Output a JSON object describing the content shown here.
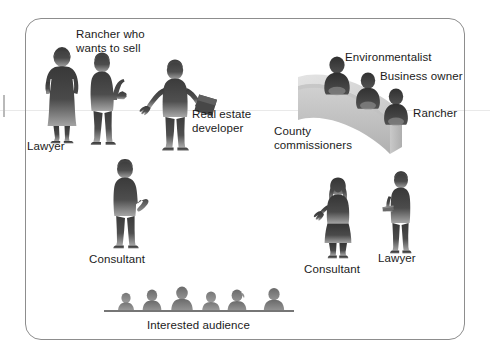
{
  "scene": {
    "title": "Stakeholders at a county land-use hearing",
    "width": 490,
    "height": 354,
    "background_color": "#ffffff",
    "frame_color": "#8d8d8d",
    "silhouette_dark": "#3b3b3b",
    "silhouette_mid": "#565656",
    "silhouette_light": "#9a9a9a",
    "bench_light": "#d9d9d9",
    "bench_mid": "#c2c2c2",
    "bench_shadow": "#a8a8a8",
    "text_color": "#1b1b1b"
  },
  "labels": {
    "lawyer_left": "Lawyer",
    "rancher_who_wants_to_sell": "Rancher who\nwants to sell",
    "real_estate_developer": "Real estate\ndeveloper",
    "consultant_left": "Consultant",
    "environmentalist": "Environmentalist",
    "business_owner": "Business owner",
    "rancher_bench": "Rancher",
    "county_commissioners": "County\ncommissioners",
    "consultant_right": "Consultant",
    "lawyer_right": "Lawyer",
    "interested_audience": "Interested audience"
  },
  "figures": [
    {
      "name": "lawyer-left",
      "role": "Lawyer",
      "posture": "standing, hands on hips",
      "gender_presentation": "female",
      "x": 38,
      "y": 48
    },
    {
      "name": "rancher-who-wants-to-sell",
      "role": "Rancher who wants to sell",
      "posture": "standing, arm extended",
      "gender_presentation": "male",
      "x": 82,
      "y": 52
    },
    {
      "name": "real-estate-developer",
      "role": "Real estate developer",
      "posture": "standing, holding folder",
      "gender_presentation": "male",
      "x": 142,
      "y": 58
    },
    {
      "name": "consultant-left",
      "role": "Consultant",
      "posture": "standing, gesturing",
      "gender_presentation": "male",
      "x": 104,
      "y": 158
    },
    {
      "name": "consultant-right",
      "role": "Consultant",
      "posture": "standing, gesturing",
      "gender_presentation": "female",
      "x": 315,
      "y": 178
    },
    {
      "name": "lawyer-right",
      "role": "Lawyer",
      "posture": "standing, holding papers",
      "gender_presentation": "male",
      "x": 381,
      "y": 172
    },
    {
      "name": "environmentalist",
      "role": "Environmentalist",
      "posture": "seated at bench",
      "x": 325,
      "y": 57
    },
    {
      "name": "business-owner",
      "role": "Business owner",
      "posture": "seated at bench",
      "x": 356,
      "y": 73
    },
    {
      "name": "rancher-bench",
      "role": "Rancher",
      "posture": "seated at bench",
      "x": 384,
      "y": 89
    }
  ],
  "audience": {
    "label": "Interested audience",
    "count": 6,
    "seated_row_y": 312
  }
}
